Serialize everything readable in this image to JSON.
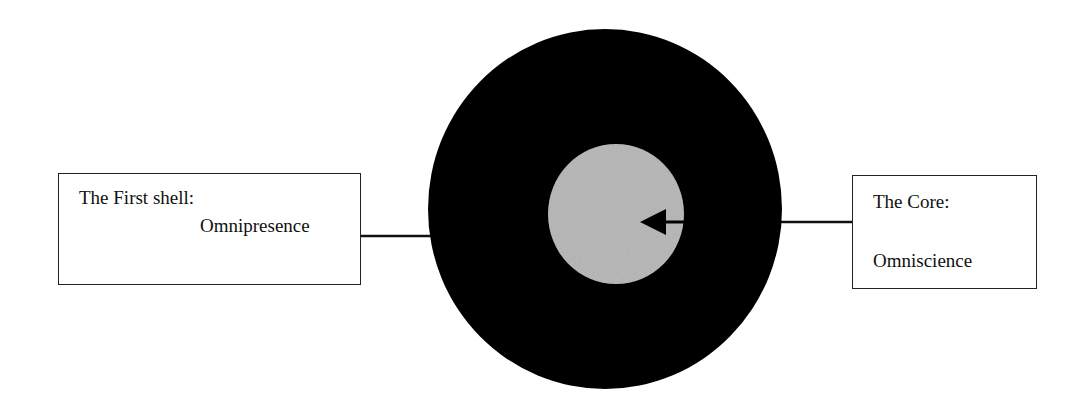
{
  "diagram": {
    "type": "concentric-circle-model",
    "colors": {
      "background": "#ffffff",
      "outer_shell": "#000000",
      "core": "#b5b5b5",
      "lines": "#111111",
      "arrow": "#000000"
    },
    "outer_shell": {
      "label": {
        "title": "The First shell:",
        "name": "Omnipresence"
      }
    },
    "core": {
      "label": {
        "title": "The Core:",
        "name": "Omniscience"
      }
    },
    "arrow": {
      "direction": "left",
      "points_to": "core"
    }
  }
}
